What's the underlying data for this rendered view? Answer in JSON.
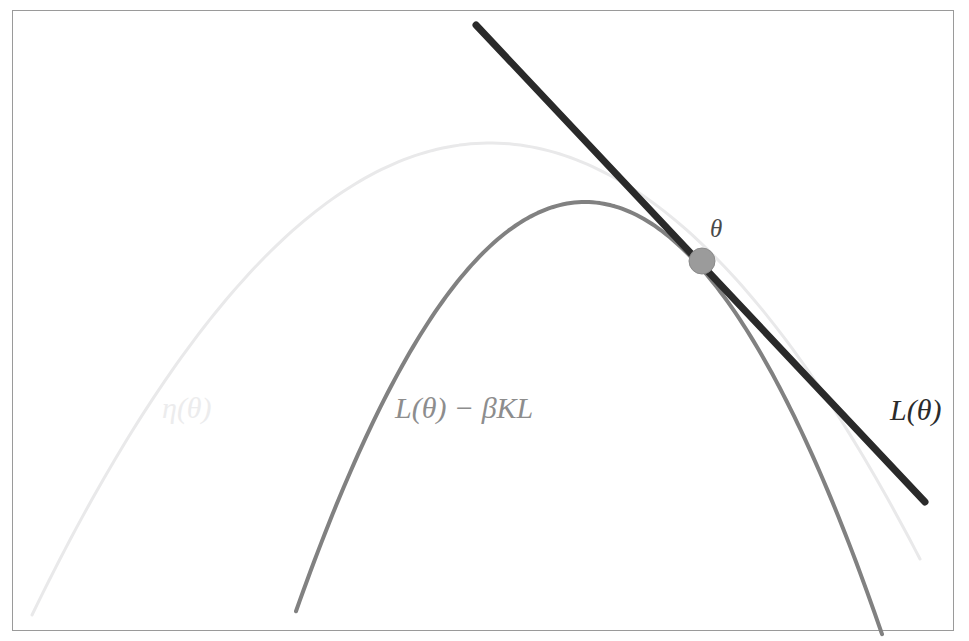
{
  "figure": {
    "kind": "mathematical-plot",
    "background_color": "#ffffff",
    "border": {
      "color": "#9a9a9a",
      "width_px": 1,
      "x": 12,
      "y": 10,
      "width": 941,
      "height": 620
    }
  },
  "labels": {
    "eta": "η(θ)",
    "penalized": "L(θ) − βKL",
    "objective": "L(θ)",
    "point": "θ"
  },
  "colors": {
    "tangent_line": "#2a2a2a",
    "penalized_curve": "#818181",
    "eta_curve": "#e9e9ea",
    "point_marker": "#9b9b9b",
    "point_marker_edge": "#8a8a8a",
    "border": "#9a9a9a",
    "label_eta": "#ececed",
    "label_penalized": "#8d8d8d",
    "label_objective": "#2b2b2b",
    "label_point": "#4a4a4a"
  },
  "chart_data": {
    "type": "line",
    "title": "",
    "subtitle": "",
    "xlabel": "",
    "ylabel": "",
    "grid": false,
    "legend_position": "inline-annotations",
    "axis_visible": false,
    "xlim": [
      0,
      969
    ],
    "ylim": [
      641,
      0
    ],
    "note": "Pixel coordinates; y increases downward as in image space.",
    "series": [
      {
        "name": "η(θ)",
        "role": "unpenalized-objective",
        "type": "parabola",
        "color": "#e9e9ea",
        "stroke_width": 3,
        "vertex": [
          490,
          143
        ],
        "endpoints": [
          [
            32,
            615
          ],
          [
            920,
            613
          ]
        ],
        "coefficient_a": 0.00225,
        "points": [
          [
            32,
            615
          ],
          [
            80,
            518
          ],
          [
            130,
            431
          ],
          [
            180,
            355
          ],
          [
            230,
            291
          ],
          [
            280,
            238
          ],
          [
            330,
            196
          ],
          [
            380,
            165
          ],
          [
            430,
            152
          ],
          [
            490,
            143
          ],
          [
            540,
            149
          ],
          [
            590,
            167
          ],
          [
            640,
            197
          ],
          [
            690,
            239
          ],
          [
            740,
            292
          ],
          [
            790,
            357
          ],
          [
            840,
            433
          ],
          [
            880,
            504
          ],
          [
            920,
            613
          ]
        ]
      },
      {
        "name": "L(θ) − βKL",
        "role": "kl-penalized-objective",
        "type": "parabola",
        "color": "#818181",
        "stroke_width": 4,
        "vertex": [
          585,
          202
        ],
        "endpoints": [
          [
            296,
            610
          ],
          [
            882,
            617
          ]
        ],
        "coefficient_a": 0.0049,
        "points": [
          [
            296,
            610
          ],
          [
            330,
            513
          ],
          [
            370,
            415
          ],
          [
            410,
            333
          ],
          [
            450,
            268
          ],
          [
            490,
            221
          ],
          [
            530,
            205
          ],
          [
            585,
            202
          ],
          [
            620,
            208
          ],
          [
            660,
            230
          ],
          [
            700,
            268
          ],
          [
            740,
            322
          ],
          [
            780,
            393
          ],
          [
            820,
            480
          ],
          [
            855,
            570
          ],
          [
            882,
            617
          ]
        ]
      },
      {
        "name": "L(θ)",
        "role": "tangent-line",
        "type": "line",
        "color": "#2a2a2a",
        "stroke_width": 7,
        "endpoints": [
          [
            476,
            25
          ],
          [
            925,
            502
          ]
        ],
        "slope": 1.0624,
        "tangent_point": [
          702,
          261
        ]
      }
    ],
    "markers": [
      {
        "name": "θ",
        "x": 702,
        "y": 261,
        "radius": 13,
        "color": "#9b9b9b"
      }
    ],
    "annotations": [
      {
        "text": "η(θ)",
        "x": 162,
        "y": 418,
        "color": "#ececed"
      },
      {
        "text": "L(θ) − βKL",
        "x": 395,
        "y": 418,
        "color": "#8d8d8d"
      },
      {
        "text": "L(θ)",
        "x": 890,
        "y": 420,
        "color": "#2b2b2b"
      },
      {
        "text": "θ",
        "x": 710,
        "y": 237,
        "color": "#4a4a4a"
      }
    ]
  }
}
